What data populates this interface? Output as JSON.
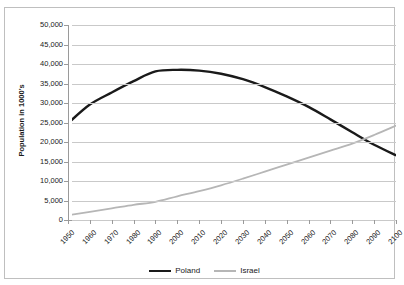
{
  "chart_data": {
    "type": "line",
    "title_visible": false,
    "xlabel": "",
    "ylabel": "Population in 1000's",
    "x": [
      1950,
      1960,
      1970,
      1980,
      1990,
      2000,
      2010,
      2020,
      2030,
      2040,
      2050,
      2060,
      2070,
      2080,
      2090,
      2100
    ],
    "xtick_labels": [
      "1950",
      "1960",
      "1970",
      "1980",
      "1990",
      "2000",
      "2010",
      "2020",
      "2030",
      "2040",
      "2050",
      "2060",
      "2070",
      "2080",
      "2090",
      "2100"
    ],
    "ytick_labels": [
      "50,000",
      "45,000",
      "40,000",
      "35,000",
      "30,000",
      "25,000",
      "20,000",
      "15,000",
      "10,000",
      "5,000",
      "0"
    ],
    "ytick_values": [
      50000,
      45000,
      40000,
      35000,
      30000,
      25000,
      20000,
      15000,
      10000,
      5000,
      0
    ],
    "ylim": [
      0,
      50000
    ],
    "xlim": [
      1950,
      2100
    ],
    "grid": "horizontal",
    "legend_position": "bottom-center",
    "series": [
      {
        "name": "Poland",
        "color": "#1a1a1a",
        "width": 2.4,
        "values": [
          24800,
          29600,
          32700,
          35600,
          38100,
          38500,
          38300,
          37500,
          36100,
          34100,
          31700,
          29000,
          25800,
          22500,
          19300,
          16600
        ]
      },
      {
        "name": "Israel",
        "color": "#b6b6b6",
        "width": 1.8,
        "values": [
          1200,
          2100,
          2970,
          3880,
          4660,
          6080,
          7420,
          8900,
          10600,
          12400,
          14200,
          16000,
          17800,
          19600,
          21800,
          24200
        ]
      }
    ]
  },
  "legend": {
    "entries": [
      {
        "label": "Poland"
      },
      {
        "label": "Israel"
      }
    ]
  },
  "colors": {
    "poland": "#1a1a1a",
    "israel": "#b6b6b6",
    "gridline": "#c9c9c9",
    "axis": "#9a9a9a",
    "border": "#bfbfbf",
    "text": "#1a1a1a",
    "background": "#ffffff"
  }
}
